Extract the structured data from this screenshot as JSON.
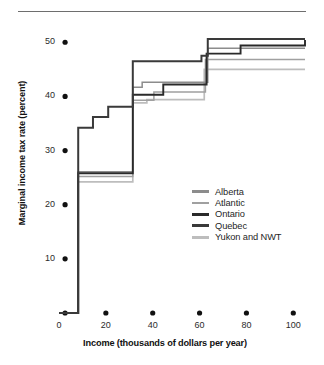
{
  "chart_data": {
    "type": "line",
    "title": "",
    "subtitle": "",
    "xlabel": "Income (thousands of dollars per year)",
    "ylabel": "Marginal income tax rate (percent)",
    "xlim": [
      0,
      105
    ],
    "ylim": [
      0,
      53
    ],
    "xticks": [
      0,
      20,
      40,
      60,
      80,
      100
    ],
    "xtick_labels": [
      "0",
      "20",
      "40",
      "60",
      "80",
      "100"
    ],
    "yticks": [
      0,
      10,
      20,
      30,
      40,
      50
    ],
    "ytick_labels": [
      "",
      "10",
      "20",
      "30",
      "40",
      "50"
    ],
    "grid": false,
    "legend_position": "center-right",
    "step_style": "post",
    "annotations": [],
    "series": [
      {
        "name": "Alberta",
        "color": "#8c8c8c",
        "width": 1.5,
        "x": [
          0,
          8.2,
          30.3,
          31.5,
          35.5,
          60.8,
          63.5,
          105
        ],
        "y": [
          0,
          26.1,
          26.1,
          41.7,
          42.6,
          42.6,
          48.9,
          48.9
        ]
      },
      {
        "name": "Atlantic",
        "color": "#a0a0a0",
        "width": 1.5,
        "x": [
          0,
          8.2,
          30.3,
          31.5,
          40.5,
          60.8,
          62.5,
          105
        ],
        "y": [
          0,
          25.2,
          25.2,
          39.3,
          40.8,
          40.8,
          46.8,
          46.8
        ]
      },
      {
        "name": "Ontario",
        "color": "#2a2a2a",
        "width": 1.9,
        "x": [
          0,
          8.2,
          30.3,
          31.5,
          44.5,
          60.8,
          63.0,
          77.5,
          105
        ],
        "y": [
          0,
          25.8,
          25.8,
          40.3,
          42.2,
          42.2,
          47.9,
          49.4,
          50.4
        ]
      },
      {
        "name": "Quebec",
        "color": "#3a3a3a",
        "width": 2.0,
        "x": [
          0,
          8.2,
          14.5,
          21.0,
          30.3,
          31.5,
          51.5,
          60.8,
          63.5,
          105
        ],
        "y": [
          0,
          34.2,
          36.2,
          38.1,
          38.1,
          46.5,
          46.5,
          47.5,
          50.6,
          50.6
        ]
      },
      {
        "name": "Yukon and NWT",
        "color": "#bdbdbd",
        "width": 1.7,
        "x": [
          0,
          8.2,
          30.3,
          31.5,
          37.5,
          60.8,
          62.0,
          105
        ],
        "y": [
          0,
          24.2,
          24.2,
          38.8,
          39.4,
          39.4,
          45.0,
          45.0
        ]
      }
    ]
  },
  "legend": {
    "items": [
      {
        "label": "Alberta",
        "color": "#8c8c8c"
      },
      {
        "label": "Atlantic",
        "color": "#a0a0a0"
      },
      {
        "label": "Ontario",
        "color": "#2a2a2a"
      },
      {
        "label": "Quebec",
        "color": "#3a3a3a"
      },
      {
        "label": "Yukon and NWT",
        "color": "#bdbdbd"
      }
    ]
  },
  "axes": {
    "x_label": "Income (thousands of dollars per year)",
    "y_label": "Marginal income tax rate (percent)",
    "x_tick_labels": [
      "0",
      "20",
      "40",
      "60",
      "80",
      "100"
    ],
    "y_tick_labels": [
      "50",
      "40",
      "30",
      "20",
      "10"
    ]
  },
  "colors": {
    "rule": "#6e6e6e",
    "tick_dot": "#111111",
    "text": "#1a1a1a",
    "background": "#ffffff"
  }
}
